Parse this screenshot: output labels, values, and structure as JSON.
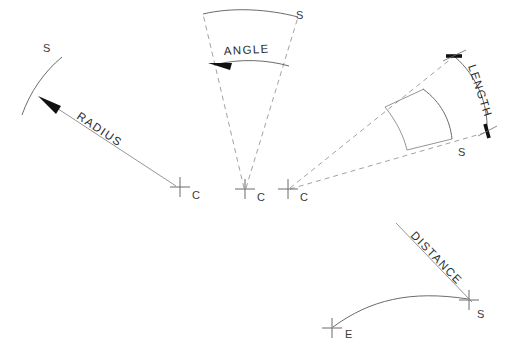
{
  "diagram": {
    "type": "engineering-line-drawing",
    "background_color": "#ffffff",
    "line_color": "#6b6b6b",
    "text_color": "#2b2b2b",
    "arrow_color": "#111111",
    "panels": [
      {
        "id": "radius",
        "dimension_label": "RADIUS",
        "point_labels": [
          {
            "name": "start-point",
            "text": "S"
          },
          {
            "name": "center-point",
            "text": "C"
          }
        ],
        "description": "Arc with leader arrow from center C to curve at S labeled RADIUS"
      },
      {
        "id": "angle",
        "dimension_label": "ANGLE",
        "point_labels": [
          {
            "name": "start-point",
            "text": "S"
          },
          {
            "name": "center-point",
            "text": "C"
          }
        ],
        "description": "Wedge of two dashed radii from C with arc labeled ANGLE"
      },
      {
        "id": "length",
        "dimension_label": "LENGTH",
        "point_labels": [
          {
            "name": "start-point",
            "text": "S"
          },
          {
            "name": "center-point",
            "text": "C"
          }
        ],
        "description": "Wedge from C with outer arc measured between two tick marks labeled LENGTH"
      },
      {
        "id": "distance",
        "dimension_label": "DISTANCE",
        "point_labels": [
          {
            "name": "end-point",
            "text": "E"
          },
          {
            "name": "start-point",
            "text": "S"
          }
        ],
        "description": "Curve from E to S with straight dimension line labeled DISTANCE"
      }
    ],
    "labels": {
      "radius": "RADIUS",
      "angle": "ANGLE",
      "length": "LENGTH",
      "distance": "DISTANCE",
      "s": "S",
      "c": "C",
      "e": "E"
    }
  }
}
